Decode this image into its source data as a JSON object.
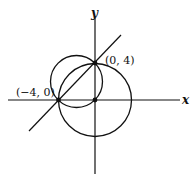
{
  "diagram": {
    "type": "coordinate-geometry",
    "axes": {
      "x_label": "x",
      "y_label": "y"
    },
    "points": [
      {
        "label": "(0, 4)",
        "x": 0,
        "y": 4
      },
      {
        "label": "(−4, 0)",
        "x": -4,
        "y": 0
      },
      {
        "label": "",
        "x": 0,
        "y": 0
      }
    ],
    "line": {
      "description": "line through (-4,0) and (0,4)",
      "equation": "y = x + 4"
    },
    "circles": [
      {
        "name": "small-circle",
        "center": [
          -2,
          2
        ],
        "radius": "2√2"
      },
      {
        "name": "large-circle",
        "center": [
          0,
          0
        ],
        "radius": 4
      }
    ],
    "stroke_color": "#111111"
  }
}
